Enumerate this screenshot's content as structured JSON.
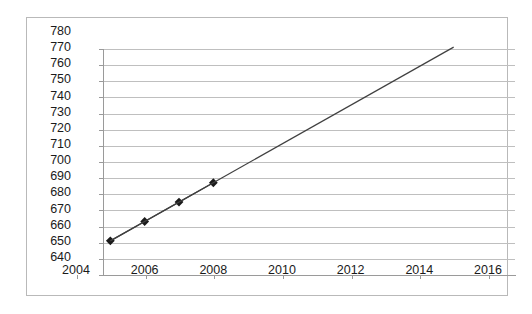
{
  "chart_data": {
    "type": "line",
    "title": "",
    "subtitle": "",
    "xlabel": "",
    "ylabel": "",
    "xlim": [
      2004,
      2016
    ],
    "ylim": [
      640,
      780
    ],
    "x_ticks": [
      2004,
      2006,
      2008,
      2010,
      2012,
      2014,
      2016
    ],
    "x_tick_labels": [
      "2004",
      "2006",
      "2008",
      "2010",
      "2012",
      "2014",
      "2016"
    ],
    "y_ticks": [
      640,
      650,
      660,
      670,
      680,
      690,
      700,
      710,
      720,
      730,
      740,
      750,
      760,
      770,
      780
    ],
    "y_tick_labels": [
      "640",
      "650",
      "660",
      "670",
      "680",
      "690",
      "700",
      "710",
      "720",
      "730",
      "740",
      "750",
      "760",
      "770",
      "780"
    ],
    "grid": true,
    "grid_axis": "y",
    "legend": false,
    "legend_position": "none",
    "annotations": [],
    "series": [
      {
        "name": "data",
        "marker": "diamond",
        "marker_color": "#1a1a1a",
        "line_color": "#404040",
        "x": [
          2005,
          2006,
          2007,
          2008
        ],
        "values": [
          650,
          662,
          674,
          686
        ]
      },
      {
        "name": "trendline",
        "marker": "none",
        "line_color": "#404040",
        "x": [
          2005,
          2015
        ],
        "values": [
          650,
          770
        ]
      }
    ]
  },
  "colors": {
    "frame_border": "#b9b9b9",
    "gridline": "#bfbfbf",
    "axis": "#9a9a9a",
    "plot_background": "#ffffff",
    "page_background": "#ffffff",
    "label_text": "#1a1a1a",
    "series_line": "#404040",
    "series_marker": "#1a1a1a"
  }
}
